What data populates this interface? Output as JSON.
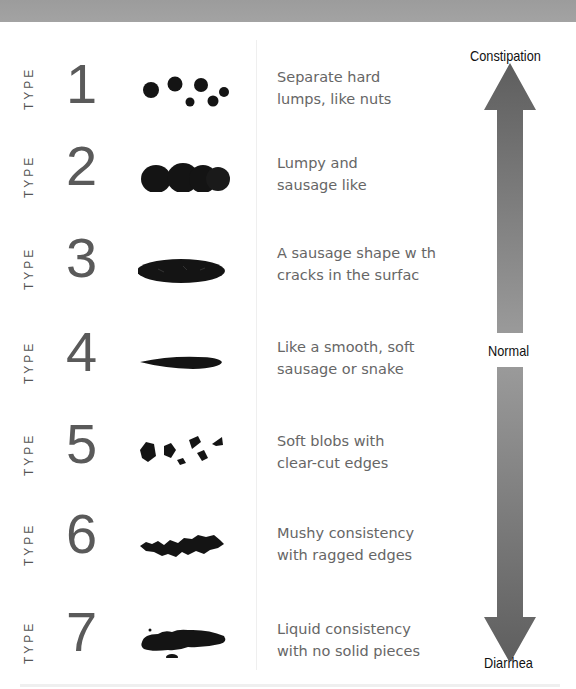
{
  "chart_title": "Bristol Stool Chart",
  "type_prefix": "TYPE",
  "types": [
    {
      "number": "1",
      "line1": "Separate hard",
      "line2": "lumps, like nuts",
      "icon": "separate-lumps"
    },
    {
      "number": "2",
      "line1": "Lumpy and",
      "line2": "sausage like",
      "icon": "lumpy-sausage"
    },
    {
      "number": "3",
      "line1": "A sausage shape w th",
      "line2": "cracks in the surfac",
      "icon": "cracked-sausage"
    },
    {
      "number": "4",
      "line1": "Like a smooth, soft",
      "line2": "sausage or snake",
      "icon": "smooth-snake"
    },
    {
      "number": "5",
      "line1": "Soft blobs with",
      "line2": "clear-cut edges",
      "icon": "soft-blobs"
    },
    {
      "number": "6",
      "line1": "Mushy consistency",
      "line2": "with ragged edges",
      "icon": "mushy-ragged"
    },
    {
      "number": "7",
      "line1": "Liquid consistency",
      "line2": "with no solid pieces",
      "icon": "liquid"
    }
  ],
  "scale": {
    "top_label": "Constipation",
    "middle_label": "Normal",
    "bottom_label": "Diarrhea"
  },
  "colors": {
    "header_band": "#a0a0a0",
    "arrow_dark": "#5e5e5e",
    "arrow_light": "#9a9a9a",
    "stool": "#141414",
    "number": "#5a5a5a",
    "description": "#666666"
  }
}
